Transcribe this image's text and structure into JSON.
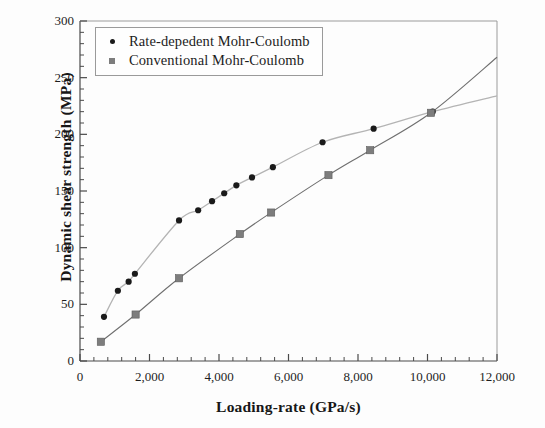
{
  "chart_data": {
    "type": "scatter",
    "title": "",
    "xlabel": "Loading-rate (GPa/s)",
    "ylabel": "Dynamic shear strength (MPa)",
    "xlim": [
      0,
      12000
    ],
    "ylim": [
      0,
      300
    ],
    "xticks": [
      "0",
      "2,000",
      "4,000",
      "6,000",
      "8,000",
      "10,000",
      "12,000"
    ],
    "xtick_values": [
      0,
      2000,
      4000,
      6000,
      8000,
      10000,
      12000
    ],
    "yticks": [
      "0",
      "50",
      "100",
      "150",
      "200",
      "250",
      "300"
    ],
    "ytick_values": [
      0,
      50,
      100,
      150,
      200,
      250,
      300
    ],
    "minor_ticks_per_interval": 5,
    "grid": false,
    "legend_position": "top-left",
    "series": [
      {
        "name": "Rate-depedent Mohr-Coulomb",
        "marker": "circle",
        "color": "#1a1a1a",
        "line_color": "#b4b4b4",
        "points": [
          [
            690,
            39
          ],
          [
            1090,
            62
          ],
          [
            1400,
            70
          ],
          [
            1580,
            77
          ],
          [
            2850,
            124
          ],
          [
            3400,
            133
          ],
          [
            3800,
            141
          ],
          [
            4150,
            148
          ],
          [
            4500,
            155
          ],
          [
            4950,
            162
          ],
          [
            5550,
            171
          ],
          [
            6980,
            193
          ],
          [
            8450,
            205
          ],
          [
            10150,
            220
          ],
          [
            12000,
            234
          ]
        ]
      },
      {
        "name": "Conventional Mohr-Coulomb",
        "marker": "square",
        "color": "#7d7d7d",
        "line_color": "#6f6f6f",
        "points": [
          [
            600,
            17
          ],
          [
            1600,
            41
          ],
          [
            2850,
            73
          ],
          [
            4600,
            112
          ],
          [
            5500,
            131
          ],
          [
            7150,
            164
          ],
          [
            8350,
            186
          ],
          [
            10100,
            219
          ],
          [
            12000,
            268
          ]
        ]
      }
    ]
  },
  "legend": {
    "items": [
      {
        "label": "Rate-depedent Mohr-Coulomb",
        "marker": "circle"
      },
      {
        "label": "Conventional Mohr-Coulomb",
        "marker": "square"
      }
    ]
  },
  "colors": {
    "axis": "#4a4a4a",
    "series1_marker": "#1a1a1a",
    "series1_line": "#bfbfbf",
    "series2_marker": "#7d7d7d",
    "series2_line": "#6f6f6f",
    "text": "#1a1a1a"
  }
}
